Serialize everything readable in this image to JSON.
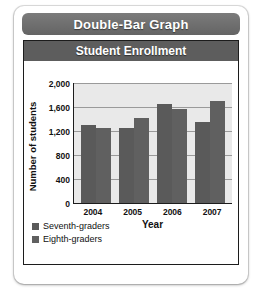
{
  "card": {
    "header_title": "Double-Bar Graph"
  },
  "chart_data": {
    "type": "bar",
    "title": "Student Enrollment",
    "xlabel": "Year",
    "ylabel": "Number of students",
    "categories": [
      "2004",
      "2005",
      "2006",
      "2007"
    ],
    "series": [
      {
        "name": "Seventh-graders",
        "values": [
          1300,
          1250,
          1650,
          1350
        ],
        "color": "#5a5a5a"
      },
      {
        "name": "Eighth-graders",
        "values": [
          1250,
          1420,
          1570,
          1700
        ],
        "color": "#606060"
      }
    ],
    "ylim": [
      0,
      2000
    ],
    "yticks": [
      "0",
      "400",
      "800",
      "1,200",
      "1,600",
      "2,000"
    ],
    "ytick_values": [
      0,
      400,
      800,
      1200,
      1600,
      2000
    ],
    "grid": true,
    "legend_position": "bottom-left"
  }
}
